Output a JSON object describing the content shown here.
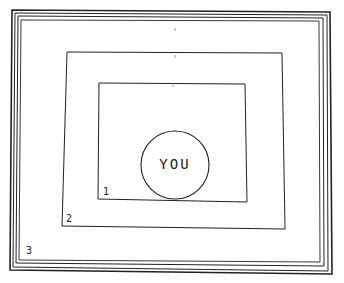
{
  "diagram": {
    "center_label": "YOU",
    "frames": [
      {
        "label": "1",
        "x": 98,
        "y": 83,
        "w": 149,
        "h": 117
      },
      {
        "label": "2",
        "x": 62,
        "y": 52,
        "w": 222,
        "h": 176
      },
      {
        "label": "3",
        "x": 18,
        "y": 14,
        "w": 306,
        "h": 252
      }
    ],
    "circle": {
      "cx": 175,
      "cy": 165,
      "r": 34
    },
    "colors": {
      "stroke": "#222222",
      "background": "#ffffff"
    }
  }
}
